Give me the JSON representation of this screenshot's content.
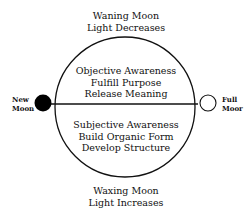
{
  "diagram": {
    "top": {
      "line1": "Waning Moon",
      "line2": "Light Decreases"
    },
    "upper_half": {
      "line1": "Objective Awareness",
      "line2": "Fulfill Purpose",
      "line3": "Release Meaning"
    },
    "lower_half": {
      "line1": "Subjective Awareness",
      "line2": "Build Organic Form",
      "line3": "Develop Structure"
    },
    "bottom": {
      "line1": "Waxing Moon",
      "line2": "Light Increases"
    },
    "left_node": {
      "line1": "New",
      "line2": "Moon",
      "fill": "#000000"
    },
    "right_node": {
      "line1": "Full",
      "line2": "Moor",
      "fill": "#ffffff"
    }
  }
}
